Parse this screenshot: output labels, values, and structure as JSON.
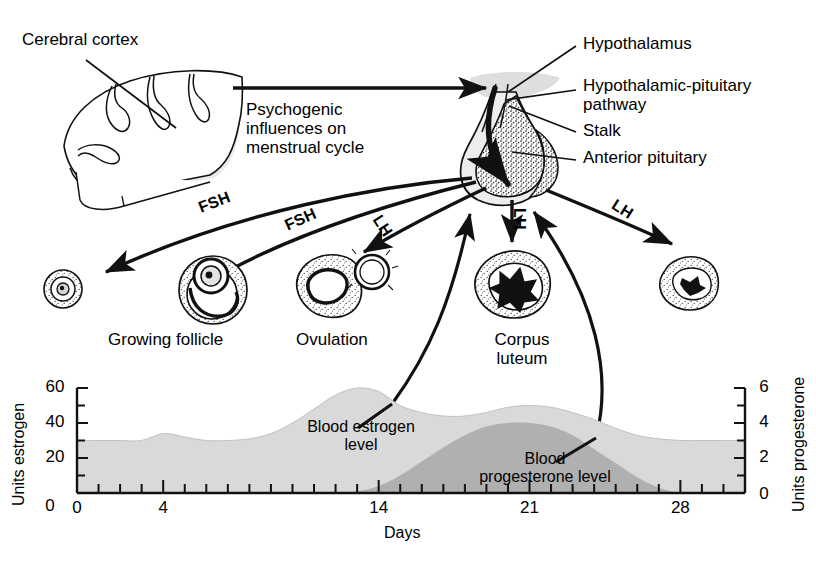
{
  "figure": {
    "ink_color": "#111111",
    "estrogen_fill": "#d9d9d9",
    "progesterone_fill": "#b0b0b0",
    "gland_fill": "#e3e3e3"
  },
  "labels": {
    "cerebral_cortex": "Cerebral cortex",
    "psychogenic_l1": "Psychogenic",
    "psychogenic_l2": "influences on",
    "psychogenic_l3": "menstrual cycle",
    "hypothalamus": "Hypothalamus",
    "pathway_l1": "Hypothalamic-pituitary",
    "pathway_l2": "pathway",
    "stalk": "Stalk",
    "anterior_pituitary": "Anterior pituitary",
    "growing_follicle": "Growing follicle",
    "ovulation": "Ovulation",
    "corpus_luteum_l1": "Corpus",
    "corpus_luteum_l2": "luteum"
  },
  "hormone_arrows": [
    {
      "name": "fsh-upper",
      "label": "FSH"
    },
    {
      "name": "fsh-lower",
      "label": "FSH"
    },
    {
      "name": "lh-to-ovulation",
      "label": "LH"
    },
    {
      "name": "lh-to-corpus-luteum",
      "label": "LH"
    },
    {
      "name": "lh-to-corpus-albicans",
      "label": "LH"
    }
  ],
  "chart_data": {
    "type": "area",
    "xlabel": "Days",
    "ylabel": "Units estrogen",
    "y2label": "Units progesterone",
    "xlim": [
      0,
      31
    ],
    "ylim": [
      0,
      60
    ],
    "y2lim": [
      0,
      6
    ],
    "xticks": [
      0,
      4,
      14,
      21,
      28
    ],
    "xtick_labels": [
      "0",
      "4",
      "14",
      "21",
      "28"
    ],
    "yticks": [
      0,
      20,
      40,
      60
    ],
    "ytick_labels": [
      "0",
      "20",
      "40",
      "60"
    ],
    "y_minor_ticks": [
      10,
      30,
      50
    ],
    "y2ticks": [
      0,
      2,
      4,
      6
    ],
    "y2tick_labels": [
      "0",
      "2",
      "4",
      "6"
    ],
    "y2_minor_ticks": [
      1,
      3,
      5
    ],
    "grid": false,
    "legend": "inline-annotation",
    "series": [
      {
        "name": "Blood estrogen level",
        "annotation": "Blood estrogen level",
        "axis": "left",
        "fill": "#d9d9d9",
        "x": [
          0,
          1,
          2,
          3,
          4,
          5,
          6,
          7,
          8,
          9,
          10,
          11,
          12,
          13,
          14,
          15,
          16,
          17,
          18,
          19,
          20,
          21,
          22,
          23,
          24,
          25,
          26,
          27,
          28,
          29,
          30,
          31
        ],
        "values": [
          30,
          30,
          30,
          30,
          34,
          32,
          30,
          30,
          31,
          34,
          40,
          48,
          56,
          60,
          58,
          50,
          46,
          44,
          44,
          46,
          49,
          50,
          49,
          46,
          42,
          37,
          33,
          31,
          30,
          30,
          30,
          30
        ]
      },
      {
        "name": "Blood progesterone level",
        "annotation": "Blood progesterone level",
        "axis": "right",
        "fill": "#b0b0b0",
        "x": [
          0,
          1,
          2,
          3,
          4,
          5,
          6,
          7,
          8,
          9,
          10,
          11,
          12,
          13,
          14,
          15,
          16,
          17,
          18,
          19,
          20,
          21,
          22,
          23,
          24,
          25,
          26,
          27,
          28,
          29,
          30,
          31
        ],
        "values": [
          0,
          0,
          0,
          0,
          0,
          0,
          0,
          0,
          0,
          0,
          0,
          0,
          0,
          0.1,
          0.4,
          1.0,
          1.8,
          2.6,
          3.3,
          3.8,
          4.0,
          4.0,
          3.8,
          3.3,
          2.5,
          1.7,
          0.9,
          0.3,
          0,
          0,
          0,
          0
        ]
      }
    ],
    "annotations": [
      {
        "name": "estrogen-callout",
        "text_l1": "Blood estrogen",
        "text_l2": "level"
      },
      {
        "name": "progesterone-callout",
        "text_l1": "Blood",
        "text_l2": "progesterone level"
      }
    ]
  }
}
